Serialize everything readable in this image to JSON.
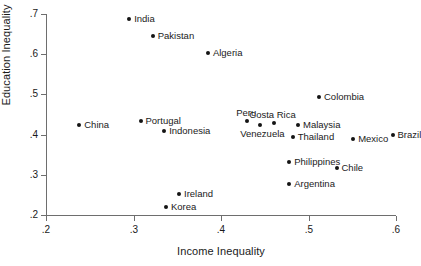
{
  "chart_data": {
    "type": "scatter",
    "title": "",
    "xlabel": "Income Inequality",
    "ylabel": "Education Inequality",
    "xlim": [
      0.2,
      0.6
    ],
    "ylim": [
      0.2,
      0.7
    ],
    "xticks": [
      ".2",
      ".3",
      ".4",
      ".5",
      ".6"
    ],
    "xtick_values": [
      0.2,
      0.3,
      0.4,
      0.5,
      0.6
    ],
    "yticks": [
      ".2",
      ".3",
      ".4",
      ".5",
      ".6",
      ".7"
    ],
    "ytick_values": [
      0.2,
      0.3,
      0.4,
      0.5,
      0.6,
      0.7
    ],
    "grid": false,
    "legend": "none",
    "point_color": "#141414",
    "axis_color": "#6e6e6e",
    "points": [
      {
        "label": "India",
        "x": 0.295,
        "y": 0.688,
        "label_pos": "right"
      },
      {
        "label": "Pakistan",
        "x": 0.322,
        "y": 0.645,
        "label_pos": "right"
      },
      {
        "label": "Algeria",
        "x": 0.385,
        "y": 0.603,
        "label_pos": "right"
      },
      {
        "label": "Colombia",
        "x": 0.512,
        "y": 0.493,
        "label_pos": "right"
      },
      {
        "label": "China",
        "x": 0.238,
        "y": 0.423,
        "label_pos": "right"
      },
      {
        "label": "Portugal",
        "x": 0.308,
        "y": 0.433,
        "label_pos": "right"
      },
      {
        "label": "Indonesia",
        "x": 0.335,
        "y": 0.41,
        "label_pos": "right"
      },
      {
        "label": "Peru",
        "x": 0.43,
        "y": 0.435,
        "label_pos": "above"
      },
      {
        "label": "Costa Rica",
        "x": 0.46,
        "y": 0.43,
        "label_pos": "above"
      },
      {
        "label": "Venezuela",
        "x": 0.445,
        "y": 0.424,
        "label_pos": "below"
      },
      {
        "label": "Malaysia",
        "x": 0.488,
        "y": 0.424,
        "label_pos": "right"
      },
      {
        "label": "Thailand",
        "x": 0.482,
        "y": 0.395,
        "label_pos": "right"
      },
      {
        "label": "Mexico",
        "x": 0.551,
        "y": 0.39,
        "label_pos": "right"
      },
      {
        "label": "Brazil",
        "x": 0.596,
        "y": 0.399,
        "label_pos": "right"
      },
      {
        "label": "Philippines",
        "x": 0.478,
        "y": 0.332,
        "label_pos": "right"
      },
      {
        "label": "Chile",
        "x": 0.532,
        "y": 0.318,
        "label_pos": "right"
      },
      {
        "label": "Argentina",
        "x": 0.478,
        "y": 0.277,
        "label_pos": "right"
      },
      {
        "label": "Ireland",
        "x": 0.352,
        "y": 0.253,
        "label_pos": "right"
      },
      {
        "label": "Korea",
        "x": 0.337,
        "y": 0.219,
        "label_pos": "right"
      }
    ]
  }
}
